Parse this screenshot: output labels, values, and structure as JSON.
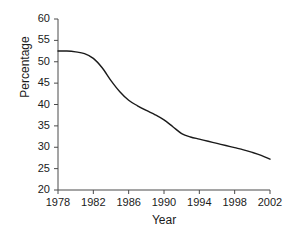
{
  "chart_data": {
    "type": "line",
    "title": "",
    "subtitle": "",
    "xlabel": "Year",
    "ylabel": "Percentage",
    "xlim": [
      1978,
      2002
    ],
    "ylim": [
      20,
      60
    ],
    "xticks": [
      1978,
      1982,
      1986,
      1990,
      1994,
      1998,
      2002
    ],
    "yticks": [
      20,
      25,
      30,
      35,
      40,
      45,
      50,
      55,
      60
    ],
    "grid": false,
    "legend": null,
    "legend_position": "none",
    "line_color": "#1a1a1a",
    "series": [
      {
        "name": "Percentage",
        "x": [
          1978,
          1979,
          1980,
          1981,
          1982,
          1983,
          1984,
          1985,
          1986,
          1987,
          1988,
          1989,
          1990,
          1991,
          1992,
          1993,
          1994,
          1995,
          1996,
          1997,
          1998,
          1999,
          2000,
          2001,
          2002
        ],
        "values": [
          52.5,
          52.5,
          52.3,
          51.9,
          50.8,
          48.6,
          45.6,
          43.0,
          41.0,
          39.7,
          38.6,
          37.6,
          36.4,
          34.8,
          33.2,
          32.4,
          31.9,
          31.4,
          30.9,
          30.4,
          29.9,
          29.4,
          28.8,
          28.1,
          27.2
        ]
      }
    ]
  },
  "axis": {
    "x_tick_labels": [
      "1978",
      "1982",
      "1986",
      "1990",
      "1994",
      "1998",
      "2002"
    ],
    "y_tick_labels": [
      "20",
      "25",
      "30",
      "35",
      "40",
      "45",
      "50",
      "55",
      "60"
    ],
    "x_axis_title": "Year",
    "y_axis_title": "Percentage"
  }
}
